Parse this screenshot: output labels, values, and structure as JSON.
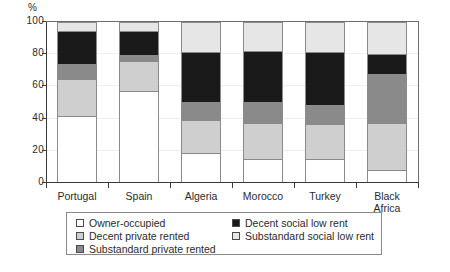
{
  "chart_data": {
    "type": "bar",
    "subtype": "stacked-bar-100",
    "title": "",
    "xlabel": "",
    "ylabel": "%",
    "ylim": [
      0,
      100
    ],
    "yticks": [
      0,
      20,
      40,
      60,
      80,
      100
    ],
    "grid": true,
    "legend_position": "bottom",
    "categories": [
      "Portugal",
      "Spain",
      "Algeria",
      "Morocco",
      "Turkey",
      "Black Africa"
    ],
    "series": [
      {
        "name": "Owner-occupied",
        "color": "#ffffff",
        "values": [
          42,
          58,
          18,
          14,
          14,
          7
        ]
      },
      {
        "name": "Decent private rented",
        "color": "#cfcfcf",
        "values": [
          23,
          19,
          21,
          23,
          22,
          30
        ]
      },
      {
        "name": "Substandard private rented",
        "color": "#8a8a8a",
        "values": [
          9,
          3,
          11,
          13,
          12,
          31
        ]
      },
      {
        "name": "Decent social low rent",
        "color": "#1a1a1a",
        "values": [
          21,
          15,
          31,
          32,
          33,
          12
        ]
      },
      {
        "name": "Substandard social low rent",
        "color": "#e6e6e6",
        "values": [
          5,
          5,
          19,
          18,
          19,
          20
        ]
      }
    ]
  },
  "axis": {
    "y_unit_label": "%",
    "y_tick_labels": [
      "0",
      "20",
      "40",
      "60",
      "80",
      "100"
    ]
  },
  "category_labels": [
    {
      "line1": "Portugal",
      "line2": ""
    },
    {
      "line1": "Spain",
      "line2": ""
    },
    {
      "line1": "Algeria",
      "line2": ""
    },
    {
      "line1": "Morocco",
      "line2": ""
    },
    {
      "line1": "Turkey",
      "line2": ""
    },
    {
      "line1": "Black",
      "line2": "Africa"
    }
  ],
  "legend": {
    "left_column": [
      {
        "label": "Owner-occupied",
        "color": "#ffffff"
      },
      {
        "label": "Decent private rented",
        "color": "#cfcfcf"
      },
      {
        "label": "Substandard private rented",
        "color": "#8a8a8a"
      }
    ],
    "right_column": [
      {
        "label": "Decent social low rent",
        "color": "#1a1a1a"
      },
      {
        "label": "Substandard social low rent",
        "color": "#e6e6e6"
      }
    ]
  }
}
